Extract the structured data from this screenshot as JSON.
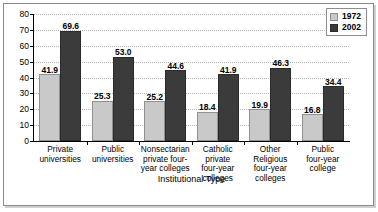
{
  "chart_data": {
    "type": "bar",
    "title": "",
    "xlabel": "Institutional Type",
    "ylabel": "Percent",
    "ylim": [
      0,
      80
    ],
    "yticks": [
      0,
      10,
      20,
      30,
      40,
      50,
      60,
      70,
      80
    ],
    "grid": true,
    "legend_position": "top-right",
    "categories": [
      "Private universities",
      "Public universities",
      "Nonsectarian private four-year colleges",
      "Catholic private four-year colleges",
      "Other Religious four-year colleges",
      "Public four-year college"
    ],
    "category_lines": [
      [
        "Private",
        "universities"
      ],
      [
        "Public",
        "universities"
      ],
      [
        "Nonsectarian",
        "private four-",
        "year colleges"
      ],
      [
        "Catholic",
        "private",
        "four-year",
        "colleges"
      ],
      [
        "Other",
        "Religious",
        "four-year",
        "colleges"
      ],
      [
        "Public",
        "four-year",
        "college"
      ]
    ],
    "series": [
      {
        "name": "1972",
        "color": "#c9c9c9",
        "values": [
          41.9,
          25.3,
          25.2,
          18.4,
          19.9,
          16.8
        ],
        "labels": [
          "41.9",
          "25.3",
          "25.2",
          "18.4",
          "19.9",
          "16.8"
        ]
      },
      {
        "name": "2002",
        "color": "#3b3b3b",
        "values": [
          69.6,
          53.0,
          44.6,
          41.9,
          46.3,
          34.4
        ],
        "labels": [
          "69.6",
          "53.0",
          "44.6",
          "41.9",
          "46.3",
          "34.4"
        ]
      }
    ]
  },
  "legend": {
    "items": [
      {
        "label": "1972"
      },
      {
        "label": "2002"
      }
    ]
  }
}
